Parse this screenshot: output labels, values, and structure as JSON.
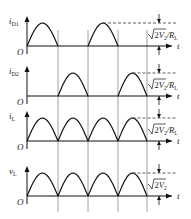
{
  "diagram": {
    "panels": [
      {
        "ylabel": "i",
        "ysub": "D1",
        "pattern": [
          1,
          0,
          1,
          0
        ],
        "peak_label": "√2V₂/R_L",
        "peak_base": "2",
        "peak_sym": "V",
        "peak_sub": "2",
        "peak_tail": "/R",
        "peak_tail_sub": "L"
      },
      {
        "ylabel": "i",
        "ysub": "D2",
        "pattern": [
          0,
          1,
          0,
          1
        ],
        "peak_label": "√2V₂/R_L",
        "peak_base": "2",
        "peak_sym": "V",
        "peak_sub": "2",
        "peak_tail": "/R",
        "peak_tail_sub": "L"
      },
      {
        "ylabel": "i",
        "ysub": "L",
        "pattern": [
          1,
          1,
          1,
          1
        ],
        "peak_label": "√2V₂/R_L",
        "peak_base": "2",
        "peak_sym": "V",
        "peak_sub": "2",
        "peak_tail": "/R",
        "peak_tail_sub": "L"
      },
      {
        "ylabel": "v",
        "ysub": "L",
        "pattern": [
          1,
          1,
          1,
          1
        ],
        "peak_label": "√2V₂",
        "peak_base": "2",
        "peak_sym": "V",
        "peak_sub": "2",
        "peak_tail": "",
        "peak_tail_sub": ""
      }
    ],
    "origin_label": "O",
    "time_label": "t"
  }
}
